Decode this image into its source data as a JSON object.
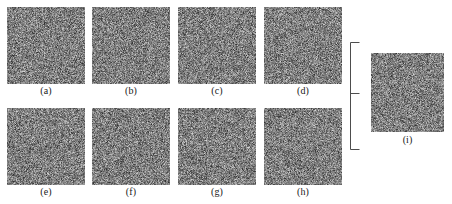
{
  "figure": {
    "width": 452,
    "height": 204,
    "background_color": "#ffffff",
    "stroke_color": "#4d4d4d",
    "label_color": "#1a1a1a",
    "noise": {
      "kind": "grayscale-random-noise",
      "mean_gray": "#808080",
      "min_gray": "#2e2e2e",
      "max_gray": "#d6d6d6"
    }
  },
  "panels": [
    {
      "id": "a",
      "label": "(a)",
      "x": 7,
      "y": 7,
      "w": 78,
      "h": 77,
      "label_x": 7,
      "label_y": 85,
      "seed": 101
    },
    {
      "id": "b",
      "label": "(b)",
      "x": 92,
      "y": 7,
      "w": 78,
      "h": 77,
      "label_x": 92,
      "label_y": 85,
      "seed": 202
    },
    {
      "id": "c",
      "label": "(c)",
      "x": 178,
      "y": 7,
      "w": 78,
      "h": 77,
      "label_x": 178,
      "label_y": 85,
      "seed": 303
    },
    {
      "id": "d",
      "label": "(d)",
      "x": 264,
      "y": 7,
      "w": 78,
      "h": 77,
      "label_x": 264,
      "label_y": 85,
      "seed": 404
    },
    {
      "id": "e",
      "label": "(e)",
      "x": 7,
      "y": 108,
      "w": 78,
      "h": 77,
      "label_x": 7,
      "label_y": 186,
      "seed": 505
    },
    {
      "id": "f",
      "label": "(f)",
      "x": 92,
      "y": 108,
      "w": 78,
      "h": 77,
      "label_x": 92,
      "label_y": 186,
      "seed": 606
    },
    {
      "id": "g",
      "label": "(g)",
      "x": 178,
      "y": 108,
      "w": 78,
      "h": 77,
      "label_x": 178,
      "label_y": 186,
      "seed": 707
    },
    {
      "id": "h",
      "label": "(h)",
      "x": 264,
      "y": 108,
      "w": 78,
      "h": 77,
      "label_x": 264,
      "label_y": 186,
      "seed": 808
    },
    {
      "id": "i",
      "label": "(i)",
      "x": 371,
      "y": 53,
      "w": 73,
      "h": 79,
      "label_x": 371,
      "label_y": 134,
      "seed": 909
    }
  ],
  "bracket": {
    "name": "grouping-bracket",
    "x": 350,
    "y": 42,
    "w": 16,
    "h": 108,
    "arm_length": 9,
    "tick_y_fraction": 0.47,
    "tick_length": 9,
    "stroke_width": 1
  }
}
